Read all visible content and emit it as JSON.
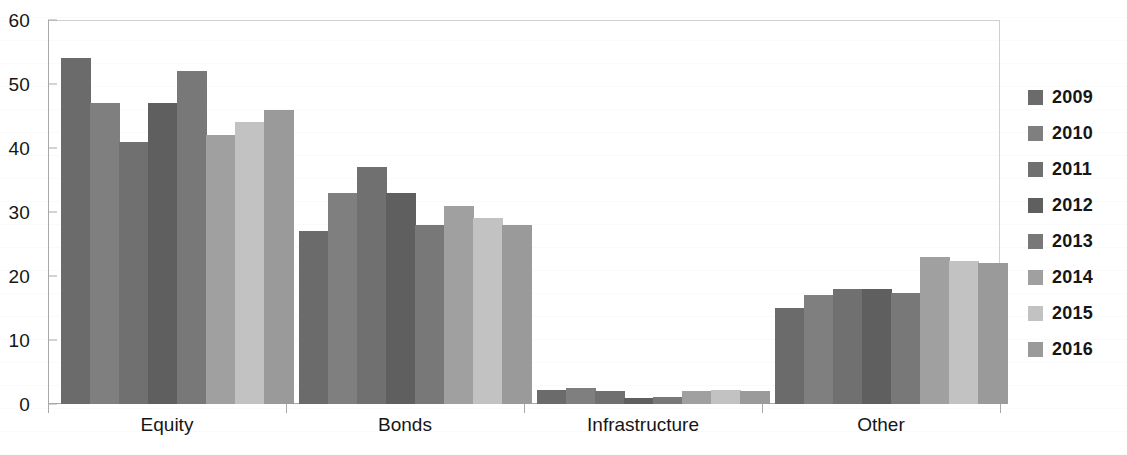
{
  "chart_data": {
    "type": "bar",
    "title": "",
    "subtitle": "",
    "xlabel": "",
    "ylabel": "",
    "categories": [
      "Equity",
      "Bonds",
      "Infrastructure",
      "Other"
    ],
    "ylim": [
      0,
      60
    ],
    "yticks": [
      0,
      10,
      20,
      30,
      40,
      50,
      60
    ],
    "ytick_labels": [
      "0",
      "10",
      "20",
      "30",
      "40",
      "50",
      "60"
    ],
    "grid": false,
    "legend_position": "right",
    "series": [
      {
        "name": "2009",
        "color": "#6b6b6b",
        "values": [
          54,
          27,
          2.2,
          15
        ]
      },
      {
        "name": "2010",
        "color": "#7f7f7f",
        "values": [
          47,
          33,
          2.5,
          17
        ]
      },
      {
        "name": "2011",
        "color": "#707070",
        "values": [
          41,
          37,
          2.0,
          18
        ]
      },
      {
        "name": "2012",
        "color": "#5f5f5f",
        "values": [
          47,
          33,
          1.0,
          18
        ]
      },
      {
        "name": "2013",
        "color": "#787878",
        "values": [
          52,
          28,
          1.1,
          17.3
        ]
      },
      {
        "name": "2014",
        "color": "#a0a0a0",
        "values": [
          42,
          31,
          2.1,
          23
        ]
      },
      {
        "name": "2015",
        "color": "#c2c2c2",
        "values": [
          44,
          29,
          2.2,
          22.4
        ]
      },
      {
        "name": "2016",
        "color": "#9a9a9a",
        "values": [
          46,
          28,
          2.0,
          22
        ]
      }
    ]
  },
  "legend": {
    "items": [
      {
        "label": "2009",
        "color": "#6b6b6b"
      },
      {
        "label": "2010",
        "color": "#7f7f7f"
      },
      {
        "label": "2011",
        "color": "#707070"
      },
      {
        "label": "2012",
        "color": "#5f5f5f"
      },
      {
        "label": "2013",
        "color": "#787878"
      },
      {
        "label": "2014",
        "color": "#a0a0a0"
      },
      {
        "label": "2015",
        "color": "#c2c2c2"
      },
      {
        "label": "2016",
        "color": "#9a9a9a"
      }
    ]
  },
  "axes": {
    "y_tick_labels": [
      "60",
      "50",
      "40",
      "30",
      "20",
      "10",
      "0"
    ],
    "x_tick_labels": [
      "Equity",
      "Bonds",
      "Infrastructure",
      "Other"
    ]
  },
  "colors": {
    "axis_line": "#a8a8a8",
    "frame_line": "#cfcfcf",
    "text": "#161616",
    "background": "#ffffff"
  }
}
